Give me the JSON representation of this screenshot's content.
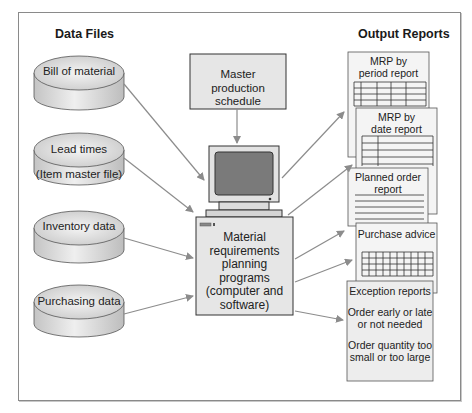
{
  "headings": {
    "left": "Data Files",
    "right": "Output Reports"
  },
  "data_files": [
    {
      "id": "bom",
      "lines": [
        "Bill of material"
      ]
    },
    {
      "id": "lead_times",
      "lines": [
        "Lead times",
        "(Item master file)"
      ]
    },
    {
      "id": "inventory",
      "lines": [
        "Inventory data"
      ]
    },
    {
      "id": "purchasing",
      "lines": [
        "Purchasing data"
      ]
    }
  ],
  "master_schedule": {
    "line1": "Master",
    "line2": "production schedule"
  },
  "mrp_programs": {
    "line1": "Material",
    "line2": "requirements",
    "line3": "planning",
    "line4": "programs",
    "line5": "(computer and",
    "line6": "software)"
  },
  "output_reports": {
    "period": {
      "line1": "MRP by",
      "line2": "period report"
    },
    "date": {
      "line1": "MRP by",
      "line2": "date report"
    },
    "planned": {
      "line1": "Planned order",
      "line2": "report"
    },
    "purchase": {
      "line1": "Purchase advice"
    },
    "exception": {
      "title": "Exception reports",
      "item1_line1": "Order early or late",
      "item1_line2": "or not needed",
      "item2_line1": "Order quantity too",
      "item2_line2": "small or too large"
    }
  },
  "colors": {
    "box_fill": "#e6e6e6",
    "border": "#333333",
    "arrow": "#8c8c8c",
    "screen": "#7a7a7a"
  }
}
